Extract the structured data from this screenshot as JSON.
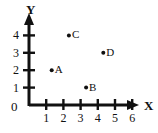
{
  "chart_data": {
    "type": "scatter",
    "title": "",
    "xlabel": "X",
    "ylabel": "Y",
    "xlim": [
      0,
      6.8
    ],
    "ylim": [
      0,
      4.8
    ],
    "xticks": [
      1,
      2,
      3,
      4,
      5,
      6
    ],
    "yticks": [
      1,
      2,
      3,
      4
    ],
    "xtick_labels": [
      "1",
      "2",
      "3",
      "4",
      "5",
      "6"
    ],
    "ytick_labels": [
      "1",
      "2",
      "3",
      "4"
    ],
    "origin_label": "0",
    "grid": false,
    "legend": "none",
    "points": [
      {
        "label": "A",
        "x": 1,
        "y": 2
      },
      {
        "label": "B",
        "x": 3,
        "y": 1
      },
      {
        "label": "C",
        "x": 2,
        "y": 4
      },
      {
        "label": "D",
        "x": 4,
        "y": 3
      }
    ],
    "colors": {
      "axis": "#111111",
      "point": "#111111",
      "background": "#ffffff"
    }
  },
  "axes": {
    "x_name": "X",
    "y_name": "Y"
  }
}
